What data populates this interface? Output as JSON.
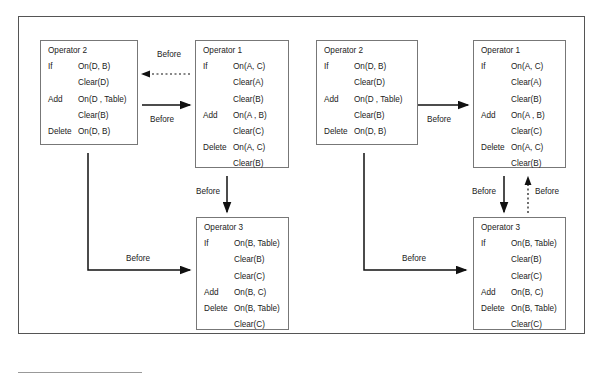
{
  "diagrams": [
    {
      "operators": [
        {
          "title": "Operator 2",
          "rows": [
            {
              "kw": "If",
              "val": "On(D, B)"
            },
            {
              "kw": "",
              "val": "Clear(D)"
            },
            {
              "kw": "Add",
              "val": "On(D , Table)"
            },
            {
              "kw": "",
              "val": "Clear(B)"
            },
            {
              "kw": "Delete",
              "val": "On(D, B)"
            }
          ]
        },
        {
          "title": "Operator 1",
          "rows": [
            {
              "kw": "If",
              "val": "On(A, C)"
            },
            {
              "kw": "",
              "val": "Clear(A)"
            },
            {
              "kw": "",
              "val": "Clear(B)"
            },
            {
              "kw": "Add",
              "val": "On(A , B)"
            },
            {
              "kw": "",
              "val": "Clear(C)"
            },
            {
              "kw": "Delete",
              "val": "On(A, C)"
            },
            {
              "kw": "",
              "val": "Clear(B)"
            }
          ]
        },
        {
          "title": "Operator 3",
          "rows": [
            {
              "kw": "If",
              "val": "On(B, Table)"
            },
            {
              "kw": "",
              "val": "Clear(B)"
            },
            {
              "kw": "",
              "val": "Clear(C)"
            },
            {
              "kw": "Add",
              "val": "On(B, C)"
            },
            {
              "kw": "Delete",
              "val": "On(B, Table)"
            },
            {
              "kw": "",
              "val": "Clear(C)"
            }
          ]
        }
      ],
      "edge_labels": [
        "Before",
        "Before",
        "Before",
        "Before"
      ]
    },
    {
      "operators": [
        {
          "title": "Operator 2",
          "rows": [
            {
              "kw": "If",
              "val": "On(D, B)"
            },
            {
              "kw": "",
              "val": "Clear(D)"
            },
            {
              "kw": "Add",
              "val": "On(D , Table)"
            },
            {
              "kw": "",
              "val": "Clear(B)"
            },
            {
              "kw": "Delete",
              "val": "On(D, B)"
            }
          ]
        },
        {
          "title": "Operator 1",
          "rows": [
            {
              "kw": "If",
              "val": "On(A, C)"
            },
            {
              "kw": "",
              "val": "Clear(A)"
            },
            {
              "kw": "",
              "val": "Clear(B)"
            },
            {
              "kw": "Add",
              "val": "On(A , B)"
            },
            {
              "kw": "",
              "val": "Clear(C)"
            },
            {
              "kw": "Delete",
              "val": "On(A, C)"
            },
            {
              "kw": "",
              "val": "Clear(B)"
            }
          ]
        },
        {
          "title": "Operator 3",
          "rows": [
            {
              "kw": "If",
              "val": "On(B, Table)"
            },
            {
              "kw": "",
              "val": "Clear(B)"
            },
            {
              "kw": "",
              "val": "Clear(C)"
            },
            {
              "kw": "Add",
              "val": "On(B, C)"
            },
            {
              "kw": "Delete",
              "val": "On(B, Table)"
            },
            {
              "kw": "",
              "val": "Clear(C)"
            }
          ]
        }
      ],
      "edge_labels": [
        "Before",
        "Before",
        "Before",
        "Before"
      ]
    }
  ]
}
